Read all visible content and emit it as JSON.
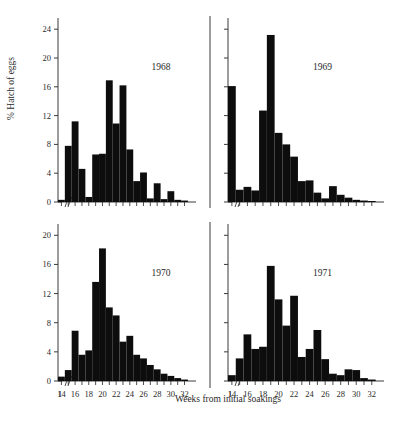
{
  "figure": {
    "xlabel": "Weeks from initial soakings",
    "ylabel": "% Hatch of eggs"
  },
  "chart_data": {
    "type": "bar",
    "title": "",
    "xlabel": "Weeks from initial soakings",
    "ylabel": "% Hatch of eggs",
    "xlim": [
      13,
      33
    ],
    "x_break_note": "axis break between 1 and 14",
    "xtick_labels": [
      "1",
      "14",
      "16",
      "18",
      "20",
      "22",
      "24",
      "26",
      "28",
      "30",
      "32"
    ],
    "xtick_values": [
      1,
      14,
      16,
      18,
      20,
      22,
      24,
      26,
      28,
      30,
      32
    ],
    "grid": false,
    "legend": "none",
    "panels": [
      {
        "label": "1968",
        "position": "top-left",
        "ylim": [
          0,
          25
        ],
        "ytick_labels": [
          "0",
          "4",
          "8",
          "12",
          "16",
          "20",
          "24"
        ],
        "ytick_values": [
          0,
          4,
          8,
          12,
          16,
          20,
          24
        ],
        "x": [
          14,
          15,
          16,
          17,
          18,
          19,
          20,
          21,
          22,
          23,
          24,
          25,
          26,
          27,
          28,
          29,
          30,
          31,
          32
        ],
        "values": [
          0.3,
          7.8,
          11.2,
          4.6,
          0.7,
          6.6,
          6.7,
          16.9,
          10.9,
          16.2,
          7.3,
          2.9,
          4.1,
          0.5,
          2.6,
          0.4,
          1.5,
          0.3,
          0.2
        ]
      },
      {
        "label": "1969",
        "position": "top-right",
        "ylim": [
          0,
          25
        ],
        "ytick_labels": [
          "0",
          "4",
          "8",
          "12",
          "16",
          "20",
          "24"
        ],
        "ytick_values": [
          0,
          4,
          8,
          12,
          16,
          20,
          24
        ],
        "x": [
          14,
          15,
          16,
          17,
          18,
          19,
          20,
          21,
          22,
          23,
          24,
          25,
          26,
          27,
          28,
          29,
          30,
          31,
          32
        ],
        "values": [
          16.1,
          1.7,
          2.1,
          1.6,
          12.7,
          23.2,
          9.6,
          8.0,
          6.3,
          2.9,
          3.0,
          1.3,
          0.5,
          2.2,
          1.0,
          0.6,
          0.3,
          0.2,
          0.1
        ]
      },
      {
        "label": "1970",
        "position": "bottom-left",
        "ylim": [
          0,
          21
        ],
        "ytick_labels": [
          "0",
          "4",
          "8",
          "12",
          "16",
          "20"
        ],
        "ytick_values": [
          0,
          4,
          8,
          12,
          16,
          20
        ],
        "x": [
          14,
          15,
          16,
          17,
          18,
          19,
          20,
          21,
          22,
          23,
          24,
          25,
          26,
          27,
          28,
          29,
          30,
          31,
          32
        ],
        "values": [
          0.6,
          1.5,
          6.9,
          3.6,
          4.2,
          13.6,
          18.2,
          10.1,
          9.0,
          5.4,
          6.2,
          3.6,
          3.1,
          2.2,
          1.6,
          1.0,
          0.7,
          0.4,
          0.2
        ]
      },
      {
        "label": "1971",
        "position": "bottom-right",
        "ylim": [
          0,
          21
        ],
        "ytick_labels": [
          "0",
          "4",
          "8",
          "12",
          "16",
          "20"
        ],
        "ytick_values": [
          0,
          4,
          8,
          12,
          16,
          20
        ],
        "x": [
          14,
          15,
          16,
          17,
          18,
          19,
          20,
          21,
          22,
          23,
          24,
          25,
          26,
          27,
          28,
          29,
          30,
          31,
          32
        ],
        "values": [
          0.8,
          3.1,
          6.4,
          4.4,
          4.7,
          15.8,
          11.2,
          7.6,
          11.7,
          3.3,
          4.4,
          7.0,
          3.0,
          1.0,
          0.8,
          1.6,
          1.5,
          0.4,
          0.2
        ]
      }
    ]
  }
}
